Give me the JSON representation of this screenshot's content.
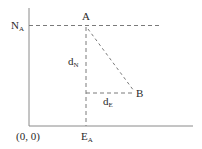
{
  "diagram": {
    "labels": {
      "n_a_main": "N",
      "n_a_sub": "A",
      "point_a": "A",
      "point_b": "B",
      "d_n_main": "d",
      "d_n_sub": "N",
      "d_e_main": "d",
      "d_e_sub": "E",
      "origin": "(0, 0)",
      "e_a_main": "E",
      "e_a_sub": "A"
    },
    "colors": {
      "axis": "#8a8a8a",
      "dashed": "#7a7a7a",
      "text": "#2a2a2a"
    }
  }
}
